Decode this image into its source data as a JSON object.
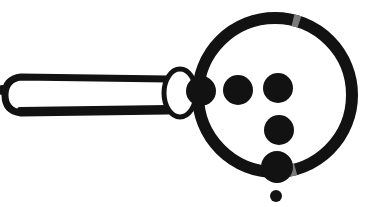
{
  "document": {
    "title": "Magnifying Glass Line Art",
    "kind": "monochrome-lineart-illustration",
    "width": 385,
    "height": 207,
    "background_color": "#ffffff",
    "ink_color": "#121212",
    "faded_ink_color": "#6f6f6f",
    "caption": ""
  },
  "palette": {
    "ink": "#121212",
    "ink_soft": "#1b1b1b",
    "gap": "#7a7a7a",
    "paper": "#ffffff"
  },
  "artwork": {
    "name": "magnifying-glass",
    "description": "Magnifying glass drawn in heavy black outline with a hollow handle and six solid dots arranged inside and beneath the lens.",
    "lens": {
      "name": "lens-ring",
      "center_x": 275,
      "center_y": 95,
      "outer_radius": 83,
      "stroke_width": 12,
      "fill": "#ffffff",
      "stroke": "#121212",
      "gaps": [
        {
          "name": "lens-gap-top",
          "angle_deg": -74,
          "arc_deg": 5,
          "color": "#7a7a7a"
        },
        {
          "name": "lens-gap-bottom",
          "angle_deg": 77,
          "arc_deg": 5,
          "color": "#7a7a7a"
        }
      ]
    },
    "joint": {
      "name": "lens-collar",
      "center_x": 180,
      "center_y": 93,
      "radius_x": 16,
      "radius_y": 24,
      "fill": "#ffffff",
      "stroke": "#121212",
      "stroke_width": 5
    },
    "handle": {
      "name": "handle-bar",
      "x": 13,
      "y": 77,
      "width": 158,
      "height": 36,
      "corner_radius": 8,
      "fill": "#ffffff",
      "stroke": "#121212",
      "stroke_width": 7,
      "taper_bottom": 4
    },
    "dots": [
      {
        "name": "dot-far-left",
        "cx": 2,
        "cy": 90,
        "r": 5,
        "fill": "#121212",
        "location": "outside-left-clipped"
      },
      {
        "name": "dot-row1-1",
        "cx": 201,
        "cy": 91,
        "r": 15,
        "fill": "#121212",
        "location": "inside-lens"
      },
      {
        "name": "dot-row1-2",
        "cx": 238,
        "cy": 90,
        "r": 15,
        "fill": "#121212",
        "location": "inside-lens"
      },
      {
        "name": "dot-row1-3",
        "cx": 278,
        "cy": 88,
        "r": 15,
        "fill": "#121212",
        "location": "inside-lens"
      },
      {
        "name": "dot-row2-1",
        "cx": 279,
        "cy": 130,
        "r": 15,
        "fill": "#121212",
        "location": "inside-lens"
      },
      {
        "name": "dot-row3-1",
        "cx": 277,
        "cy": 167,
        "r": 16,
        "fill": "#121212",
        "location": "inside-lens-on-rim"
      },
      {
        "name": "dot-below-lens",
        "cx": 276,
        "cy": 196,
        "r": 6,
        "fill": "#121212",
        "location": "outside-below"
      }
    ]
  },
  "annotations": {
    "dot_count_total": 7,
    "dot_count_in_lens": 5,
    "visible_text": ""
  }
}
